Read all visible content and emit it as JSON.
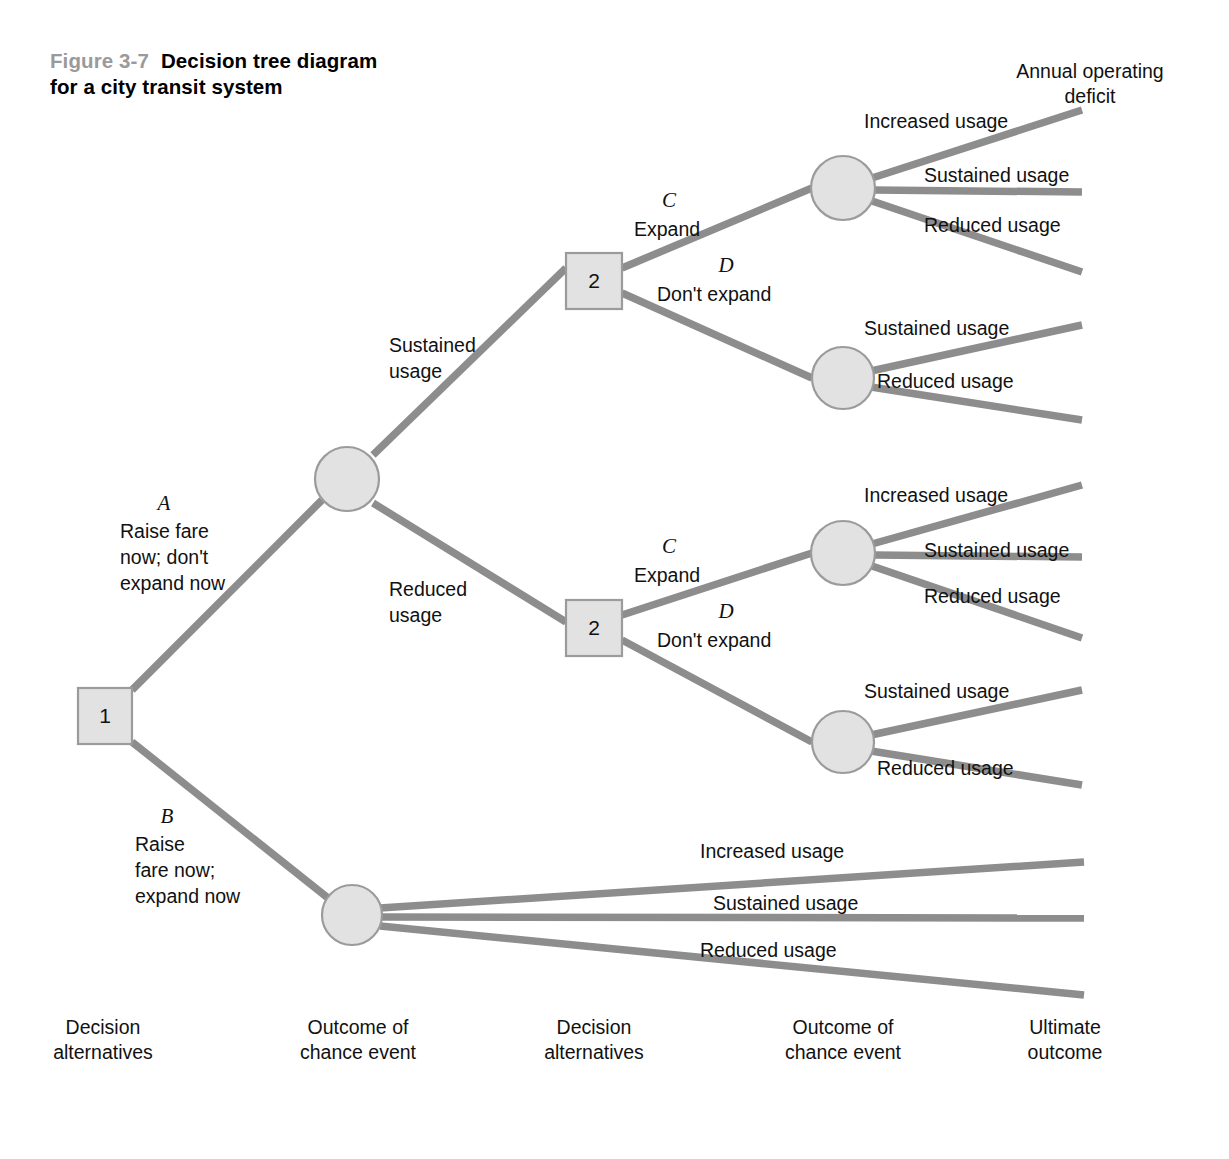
{
  "figure": {
    "number": "Figure 3-7",
    "title": "Decision tree diagram for a city transit system"
  },
  "headers": {
    "ultimate_outcome_header_line1": "Annual operating",
    "ultimate_outcome_header_line2": "deficit"
  },
  "nodes": {
    "decision_1": "1",
    "decision_2_upper": "2",
    "decision_2_lower": "2"
  },
  "alternatives": {
    "a": {
      "letter": "A",
      "line1": "Raise fare",
      "line2": "now; don't",
      "line3": "expand now"
    },
    "b": {
      "letter": "B",
      "line1": "Raise",
      "line2": "fare now;",
      "line3": "expand now"
    },
    "c_upper": {
      "letter": "C",
      "label": "Expand"
    },
    "d_upper": {
      "letter": "D",
      "label": "Don't expand"
    },
    "c_lower": {
      "letter": "C",
      "label": "Expand"
    },
    "d_lower": {
      "letter": "D",
      "label": "Don't expand"
    }
  },
  "chance_branches": {
    "first_node_upper_line1": "Sustained",
    "first_node_upper_line2": "usage",
    "first_node_lower_line1": "Reduced",
    "first_node_lower_line2": "usage",
    "n1_increased": "Increased usage",
    "n1_sustained": "Sustained usage",
    "n1_reduced": "Reduced usage",
    "n2_sustained": "Sustained usage",
    "n2_reduced": "Reduced usage",
    "n3_increased": "Increased usage",
    "n3_sustained": "Sustained usage",
    "n3_reduced": "Reduced usage",
    "n4_sustained": "Sustained usage",
    "n4_reduced": "Reduced usage",
    "n5_increased": "Increased usage",
    "n5_sustained": "Sustained usage",
    "n5_reduced": "Reduced usage"
  },
  "columns": [
    {
      "line1": "Decision",
      "line2": "alternatives"
    },
    {
      "line1": "Outcome of",
      "line2": "chance event"
    },
    {
      "line1": "Decision",
      "line2": "alternatives"
    },
    {
      "line1": "Outcome of",
      "line2": "chance event"
    },
    {
      "line1": "Ultimate",
      "line2": "outcome"
    }
  ],
  "colors": {
    "edge": "#8d8d8d",
    "node_fill": "#e2e2e2",
    "node_stroke": "#9b9b9b",
    "text": "#111111",
    "figure_number": "#9a9a9a",
    "background": "#ffffff"
  }
}
